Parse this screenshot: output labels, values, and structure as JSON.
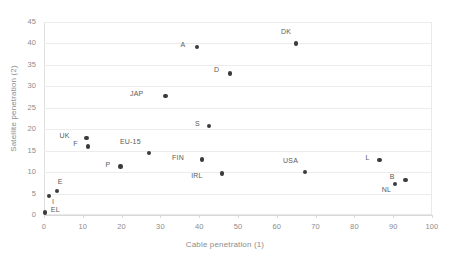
{
  "chart_data": {
    "type": "scatter",
    "title": "",
    "xlabel": "Cable penetration (1)",
    "ylabel": "Satellite penetration (2)",
    "xlim": [
      0,
      100
    ],
    "ylim": [
      0,
      45
    ],
    "xticks": [
      0,
      10,
      20,
      30,
      40,
      50,
      60,
      70,
      80,
      90,
      100
    ],
    "yticks": [
      0,
      5,
      10,
      15,
      20,
      25,
      30,
      35,
      40,
      45
    ],
    "grid": "horizontal",
    "legend": "none",
    "marker_color": "#3b3b3b",
    "grid_color": "#ececec",
    "axis_text_color": "#8c8c8c",
    "points": [
      {
        "label": "EL",
        "x": 0.2,
        "y": 0.6,
        "lx": 6,
        "ly": -2
      },
      {
        "label": "I",
        "x": 1.3,
        "y": 4.4,
        "lx": 3,
        "ly": 6
      },
      {
        "label": "E",
        "x": 3.3,
        "y": 5.6,
        "lx": 1,
        "ly": -9
      },
      {
        "label": "UK",
        "x": 11.0,
        "y": 18.0,
        "lx": -17,
        "ly": -2
      },
      {
        "label": "F",
        "x": 11.3,
        "y": 16.0,
        "lx": -10,
        "ly": -2
      },
      {
        "label": "P",
        "x": 19.7,
        "y": 11.3,
        "lx": -10,
        "ly": -2
      },
      {
        "label": "EU-15",
        "x": 27.0,
        "y": 14.5,
        "lx": -8,
        "ly": -11
      },
      {
        "label": "JAP",
        "x": 31.3,
        "y": 27.7,
        "lx": -22,
        "ly": -2
      },
      {
        "label": "A",
        "x": 39.5,
        "y": 39.2,
        "lx": -12,
        "ly": -2
      },
      {
        "label": "FIN",
        "x": 40.7,
        "y": 12.9,
        "lx": -18,
        "ly": -2
      },
      {
        "label": "S",
        "x": 42.5,
        "y": 20.8,
        "lx": -9,
        "ly": -2
      },
      {
        "label": "IRL",
        "x": 45.8,
        "y": 9.7,
        "lx": -19,
        "ly": 3
      },
      {
        "label": "D",
        "x": 48.0,
        "y": 33.0,
        "lx": -11,
        "ly": -3
      },
      {
        "label": "DK",
        "x": 65.0,
        "y": 40.0,
        "lx": -5,
        "ly": -11
      },
      {
        "label": "USA",
        "x": 67.3,
        "y": 10.0,
        "lx": -7,
        "ly": -11
      },
      {
        "label": "L",
        "x": 86.5,
        "y": 12.8,
        "lx": -10,
        "ly": -2
      },
      {
        "label": "NL",
        "x": 90.5,
        "y": 7.2,
        "lx": -4,
        "ly": 6
      },
      {
        "label": "B",
        "x": 93.2,
        "y": 8.2,
        "lx": -11,
        "ly": -3
      }
    ]
  }
}
